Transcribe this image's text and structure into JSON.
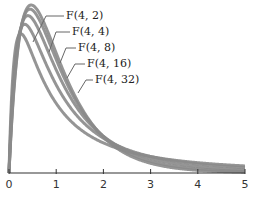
{
  "chart_data": {
    "type": "line",
    "title": "",
    "xlabel": "",
    "ylabel": "",
    "xlim": [
      0,
      5
    ],
    "ylim": [
      0,
      0.72
    ],
    "grid": false,
    "legend_position": "callout labels near curves",
    "x_ticks": [
      "0",
      "1",
      "2",
      "3",
      "4",
      "5"
    ],
    "line_color": "#8a8a8a",
    "series": [
      {
        "name": "F(4, 2)",
        "d1": 4,
        "d2": 2,
        "x": [
          0,
          0.25,
          0.5,
          1,
          2,
          3,
          4,
          5
        ],
        "values": [
          0,
          0.593,
          0.5,
          0.296,
          0.128,
          0.07,
          0.044,
          0.03
        ]
      },
      {
        "name": "F(4, 4)",
        "d1": 4,
        "d2": 4,
        "x": [
          0,
          0.33,
          0.5,
          1,
          2,
          3,
          4,
          5
        ],
        "values": [
          0,
          0.593,
          0.593,
          0.375,
          0.148,
          0.07,
          0.038,
          0.023
        ]
      },
      {
        "name": "F(4, 8)",
        "d1": 4,
        "d2": 8,
        "x": [
          0,
          0.4,
          0.5,
          1,
          2,
          3,
          4,
          5
        ],
        "values": [
          0,
          0.617,
          0.617,
          0.424,
          0.158,
          0.063,
          0.027,
          0.013
        ]
      },
      {
        "name": "F(4, 16)",
        "d1": 4,
        "d2": 16,
        "x": [
          0,
          0.44,
          0.5,
          1,
          2,
          3,
          4,
          5
        ],
        "values": [
          0,
          0.64,
          0.64,
          0.451,
          0.16,
          0.054,
          0.019,
          0.007
        ]
      },
      {
        "name": "F(4, 32)",
        "d1": 4,
        "d2": 32,
        "x": [
          0,
          0.47,
          0.5,
          1,
          2,
          3,
          4,
          5
        ],
        "values": [
          0,
          0.66,
          0.66,
          0.466,
          0.158,
          0.047,
          0.014,
          0.004
        ]
      }
    ],
    "labels": [
      {
        "text": "F(4, 2)",
        "tx": 66,
        "ty": 19,
        "lx1": 64,
        "ly1": 16,
        "lx2": 46,
        "ly2": 16,
        "ax": 33,
        "ay": 42
      },
      {
        "text": "F(4, 4)",
        "tx": 72,
        "ty": 35,
        "lx1": 70,
        "ly1": 32,
        "lx2": 56,
        "ly2": 32,
        "ax": 49,
        "ay": 52
      },
      {
        "text": "F(4, 8)",
        "tx": 78,
        "ty": 51,
        "lx1": 76,
        "ly1": 48,
        "lx2": 66,
        "ly2": 48,
        "ax": 60,
        "ay": 63
      },
      {
        "text": "F(4, 16)",
        "tx": 87,
        "ty": 67,
        "lx1": 85,
        "ly1": 64,
        "lx2": 75,
        "ly2": 64,
        "ax": 67,
        "ay": 78
      },
      {
        "text": "F(4, 32)",
        "tx": 95,
        "ty": 83,
        "lx1": 93,
        "ly1": 80,
        "lx2": 86,
        "ly2": 80,
        "ax": 78,
        "ay": 93
      }
    ]
  }
}
